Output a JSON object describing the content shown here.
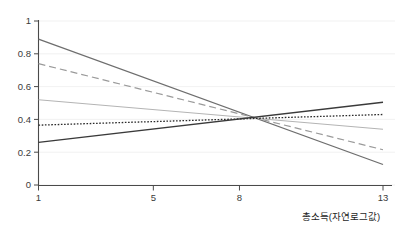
{
  "chart_data": {
    "type": "line",
    "title": "",
    "xlabel": "총소득(자연로그값)",
    "ylabel": "",
    "xlim": [
      1,
      13
    ],
    "ylim": [
      0,
      1
    ],
    "grid": true,
    "legend": "none",
    "x_ticks": [
      "1",
      "5",
      "8",
      "13"
    ],
    "x_tick_values": [
      1,
      5,
      8,
      13
    ],
    "y_ticks": [
      "0",
      "0.2",
      "0.4",
      "0.6",
      "0.8",
      "1"
    ],
    "y_tick_values": [
      0,
      0.2,
      0.4,
      0.6,
      0.8,
      1
    ],
    "convergence_point": {
      "x": 8.3,
      "y": 0.405
    },
    "series": [
      {
        "name": "series-1",
        "style": "solid",
        "color": "#6e6e6e",
        "width": 1.3,
        "x": [
          1,
          13
        ],
        "values": [
          0.89,
          0.125
        ]
      },
      {
        "name": "series-2",
        "style": "dashed",
        "color": "#9a9a9a",
        "width": 1.2,
        "x": [
          1,
          13
        ],
        "values": [
          0.74,
          0.215
        ]
      },
      {
        "name": "series-3",
        "style": "solid",
        "color": "#b4b4b4",
        "width": 1.1,
        "x": [
          1,
          13
        ],
        "values": [
          0.52,
          0.34
        ]
      },
      {
        "name": "series-4",
        "style": "dotted",
        "color": "#2a2a2a",
        "width": 1.3,
        "x": [
          1,
          13
        ],
        "values": [
          0.365,
          0.43
        ]
      },
      {
        "name": "series-5",
        "style": "solid",
        "color": "#3a3a3a",
        "width": 1.4,
        "x": [
          1,
          13
        ],
        "values": [
          0.26,
          0.505
        ]
      }
    ]
  }
}
